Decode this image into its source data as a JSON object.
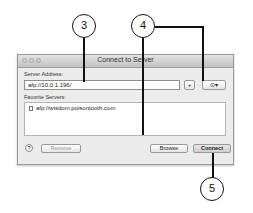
{
  "window": {
    "title": "Connect to Server",
    "server_address_label": "Server Address:",
    "server_address_value": "afp://10.0.1.196/",
    "add_button": "+",
    "recent_button": "⊙▾",
    "favorites_label": "Favorite Servers:",
    "favorites": [
      {
        "label": "afp://wisdom.poisontooth.com"
      }
    ],
    "help_button": "?",
    "remove_button": "Remove",
    "browse_button": "Browse",
    "connect_button": "Connect"
  },
  "callouts": [
    {
      "number": "3"
    },
    {
      "number": "4"
    },
    {
      "number": "5"
    }
  ]
}
